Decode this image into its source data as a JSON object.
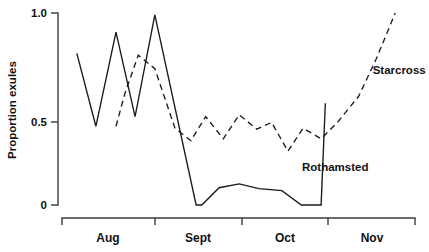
{
  "chart_data": {
    "type": "line",
    "title": "",
    "subtitle": "",
    "xlabel": "",
    "ylabel": "Proportion exules",
    "ylim": [
      0,
      1.0
    ],
    "yticks": [
      0,
      0.5,
      1.0
    ],
    "ytick_labels": [
      "0",
      "0.5",
      "1.0"
    ],
    "xlim": [
      0,
      100
    ],
    "xtick_positions": [
      0,
      26.3,
      51.0,
      75.4,
      100
    ],
    "xtick_labels": [
      "",
      "",
      "",
      "",
      ""
    ],
    "x_category_labels": [
      "Aug",
      "Sept",
      "Oct",
      "Nov"
    ],
    "x_category_centers": [
      13.2,
      38.7,
      63.2,
      87.7
    ],
    "grid": false,
    "legend_position": "inline-annotations",
    "series": [
      {
        "name": "Rothamsted",
        "style": "solid",
        "label_x": 68.0,
        "label_y": 0.195,
        "x": [
          4.2,
          9.6,
          15.3,
          20.7,
          26.3,
          38.0,
          39.6,
          44.5,
          50.2,
          55.8,
          62.3,
          67.8,
          73.4,
          74.6
        ],
        "y": [
          0.79,
          0.41,
          0.9,
          0.46,
          0.99,
          0.0,
          0.0,
          0.09,
          0.11,
          0.085,
          0.075,
          0.0,
          0.0,
          0.53
        ]
      },
      {
        "name": "Starcross",
        "style": "dashed",
        "label_x": 88.0,
        "label_y": 0.7,
        "x": [
          15.3,
          17.8,
          21.6,
          26.3,
          32.0,
          36.5,
          40.7,
          45.7,
          50.2,
          55.2,
          59.4,
          64.0,
          68.3,
          73.4,
          78.0,
          84.0,
          89.0,
          94.4
        ],
        "y": [
          0.41,
          0.58,
          0.78,
          0.71,
          0.4,
          0.335,
          0.46,
          0.345,
          0.47,
          0.395,
          0.43,
          0.28,
          0.4,
          0.345,
          0.43,
          0.565,
          0.76,
          1.0
        ]
      }
    ]
  },
  "axis": {
    "y_title": "Proportion exules",
    "y_tick_labels": [
      "1.0",
      "0.5",
      "0"
    ],
    "x_tick_labels": [
      "Aug",
      "Sept",
      "Oct",
      "Nov"
    ]
  },
  "annotations": {
    "starcross": "Starcross",
    "rothamsted": "Rothamsted"
  }
}
